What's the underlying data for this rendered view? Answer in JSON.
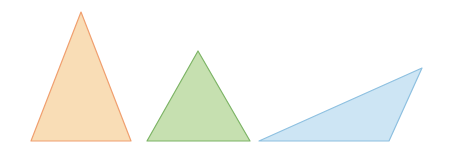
{
  "shapes": [
    {
      "name": "acute-isosceles-triangle",
      "type": "triangle",
      "points": [
        [
          81,
          12
        ],
        [
          131,
          141
        ],
        [
          31,
          141
        ]
      ],
      "fill": "#F9DDB6",
      "stroke": "#F0A070"
    },
    {
      "name": "equilateral-triangle",
      "type": "triangle",
      "points": [
        [
          198,
          51
        ],
        [
          250,
          141
        ],
        [
          147,
          141
        ]
      ],
      "fill": "#C6E0B0",
      "stroke": "#7DB466"
    },
    {
      "name": "obtuse-triangle",
      "type": "triangle",
      "points": [
        [
          422,
          68
        ],
        [
          389,
          141
        ],
        [
          259,
          141
        ]
      ],
      "fill": "#CDE5F4",
      "stroke": "#8EC0E0"
    }
  ]
}
